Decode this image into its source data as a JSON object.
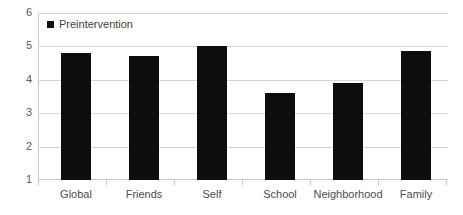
{
  "chart_data": {
    "type": "bar",
    "title": "",
    "xlabel": "",
    "ylabel": "",
    "categories": [
      "Global",
      "Friends",
      "Self",
      "School",
      "Neighborhood",
      "Family"
    ],
    "values": [
      4.8,
      4.7,
      5.0,
      3.6,
      3.9,
      4.85
    ],
    "series": [
      {
        "name": "Preintervention",
        "color": "#0d0d0d",
        "values": [
          4.8,
          4.7,
          5.0,
          3.6,
          3.9,
          4.85
        ]
      }
    ],
    "ylim": [
      1,
      6
    ],
    "yticks": [
      1,
      2,
      3,
      4,
      5,
      6
    ],
    "ytick_labels": [
      "1",
      "2",
      "3",
      "4",
      "5",
      "6"
    ],
    "grid": true,
    "legend_position": "top-left",
    "legend": [
      "Preintervention"
    ]
  },
  "legend": {
    "marker": "square-marker",
    "label": "Preintervention"
  },
  "colors": {
    "bar": "#0d0d0d",
    "grid": "#d6d6d6",
    "axis": "#c9c9c9",
    "tick_text": "#5a5a5a",
    "label_text": "#4d4d4d",
    "background": "#ffffff"
  }
}
